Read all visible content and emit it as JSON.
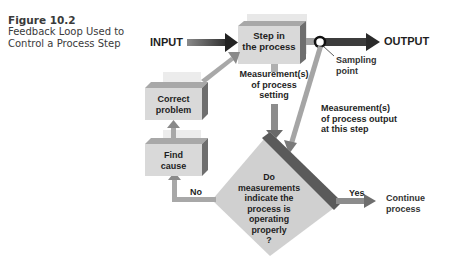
{
  "caption": {
    "figure": "Figure 10.2",
    "line1": "Feedback Loop Used to",
    "line2": "Control a Process Step"
  },
  "nodes": {
    "input": "INPUT",
    "output": "OUTPUT",
    "step": {
      "line1": "Step in",
      "line2": "the process"
    },
    "correct": {
      "line1": "Correct",
      "line2": "problem"
    },
    "find": {
      "line1": "Find",
      "line2": "cause"
    },
    "decision": {
      "line1": "Do",
      "line2": "measurements",
      "line3": "indicate the",
      "line4": "process is",
      "line5": "operating",
      "line6": "properly",
      "line7": "?"
    },
    "continue": {
      "line1": "Continue",
      "line2": "process"
    }
  },
  "labels": {
    "sampling": {
      "line1": "Sampling",
      "line2": "point"
    },
    "meas_setting": {
      "line1": "Measurement(s)",
      "line2": "of process",
      "line3": "setting"
    },
    "meas_output": {
      "line1": "Measurement(s)",
      "line2": "of process output",
      "line3": "at this step"
    },
    "no": "No",
    "yes": "Yes"
  },
  "colors": {
    "box_face": "#d9d9d9",
    "box_top": "#a8a8a8",
    "box_side": "#6e6e6e",
    "arrow_dark": "#3c3c3c",
    "arrow_light": "#9a9a9a",
    "text": "#1e1e1e"
  }
}
